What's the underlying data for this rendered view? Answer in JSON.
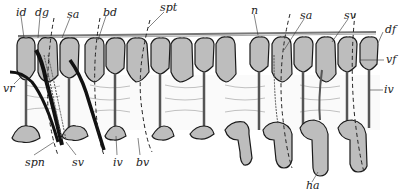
{
  "figure": {
    "colors": {
      "fill": "#bdbdbd",
      "stroke": "#1a1a1a",
      "background": "#ffffff",
      "cord": "#9a9a9a"
    }
  },
  "labels": {
    "id": {
      "text": "id",
      "x": 16,
      "y": 7
    },
    "dg": {
      "text": "dg",
      "x": 35,
      "y": 7
    },
    "sa_left": {
      "text": "sa",
      "x": 67,
      "y": 9
    },
    "bd": {
      "text": "bd",
      "x": 103,
      "y": 7
    },
    "spt": {
      "text": "spt",
      "x": 160,
      "y": 2
    },
    "n": {
      "text": "n",
      "x": 251,
      "y": 5
    },
    "sa_right": {
      "text": "sa",
      "x": 300,
      "y": 10
    },
    "sv_top": {
      "text": "sv",
      "x": 344,
      "y": 10
    },
    "df": {
      "text": "df",
      "x": 385,
      "y": 28
    },
    "vf": {
      "text": "vf",
      "x": 386,
      "y": 57
    },
    "iv_right": {
      "text": "iv",
      "x": 384,
      "y": 86
    },
    "vr": {
      "text": "vr",
      "x": 3,
      "y": 83
    },
    "spn": {
      "text": "spn",
      "x": 25,
      "y": 157
    },
    "sv_bottom": {
      "text": "sv",
      "x": 72,
      "y": 157
    },
    "iv_bottom": {
      "text": "iv",
      "x": 113,
      "y": 157
    },
    "bv": {
      "text": "bv",
      "x": 136,
      "y": 157
    },
    "ha": {
      "text": "ha",
      "x": 306,
      "y": 184
    }
  }
}
